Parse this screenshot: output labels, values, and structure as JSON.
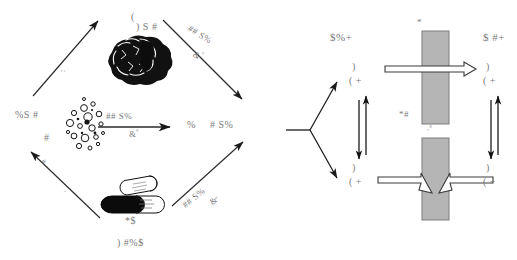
{
  "figure": {
    "background": "#ffffff",
    "ink": "#222222",
    "text_color": "#7a7a7a",
    "bar_fill": "#b3b3b3",
    "bar_stroke": "#808080"
  },
  "left_panel": {
    "name": "cycle-diagram",
    "center_label_top": ") S #",
    "center_label_top_paren": "(",
    "center_label_middle_left": "%S #",
    "center_label_middle_left2": "#",
    "center_label_middle_right": "%",
    "center_label_middle_right2": "# S%",
    "center_label_bottom_icon": "*$",
    "center_label_bottom": ") #%$",
    "arrows": [
      {
        "name": "arrow-middle-horizontal",
        "label_above": "## S%",
        "label_below": "&",
        "label_below_sup": "°"
      },
      {
        "name": "arrow-top-right-diagonal",
        "label_above": "## S%",
        "label_below": "&",
        "label_below_sup": "°"
      },
      {
        "name": "arrow-bottom-right-diagonal",
        "label_above": "## S%",
        "label_below": "&",
        "label_below_sup": "°"
      },
      {
        "name": "arrow-top-left-diagonal",
        "label_above": "'·"
      },
      {
        "name": "arrow-bottom-left-diagonal",
        "label_above": "#",
        "label_below": "·"
      }
    ],
    "illustrations": [
      {
        "name": "blob-illustration",
        "caption": ") S #"
      },
      {
        "name": "particles-illustration",
        "caption": ""
      },
      {
        "name": "capsule-illustration",
        "caption": "*$"
      }
    ]
  },
  "right_panel": {
    "name": "flow-schematic",
    "label_top_left": "$%+",
    "label_top_right": "$ #+",
    "label_star_top": "*",
    "label_star_hash": "*#",
    "label_tick_mid": ",°",
    "nodes": [
      {
        "name": "node-upper-left",
        "line1": ")",
        "line2": "( +"
      },
      {
        "name": "node-lower-left",
        "line1": ")",
        "line2": "( +"
      },
      {
        "name": "node-upper-right",
        "line1": ")",
        "line2": "( +"
      },
      {
        "name": "node-lower-right",
        "line1": ")",
        "line2": "( +"
      }
    ],
    "bars": [
      {
        "name": "membrane-bar-top"
      },
      {
        "name": "membrane-bar-bottom"
      }
    ]
  }
}
